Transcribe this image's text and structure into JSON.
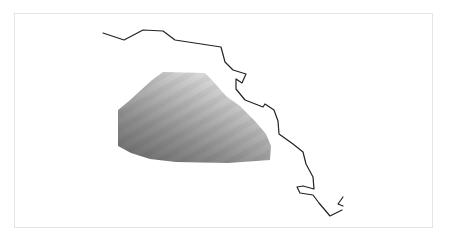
{
  "map": {
    "frame": {
      "x": 14,
      "y": 13,
      "width": 419,
      "height": 215,
      "border_color": "#e4e4e4"
    },
    "coastline": {
      "stroke": "#222222",
      "stroke_width": 1.2,
      "main_path": "M103,33 L124,40 L143,30 L163,31 L175,40 L221,47 L225,62 L233,70 L246,74 L242,83 L236,79 L236,89 L245,100 L263,107 L265,104 L274,110 L278,121 L279,134 L293,144 L303,152 L306,164 L313,177 L314,189 L303,186 L297,187 L300,193 L313,195 L319,203 L330,216 L342,210",
      "fragment_path": "M343,197 L338,204 L343,206"
    },
    "heat_region": {
      "outline": "M163,72 L205,73 L212,80 L226,96 L240,106 L254,120 L266,134 L271,146 L270,160 L228,163 L176,162 L150,159 L131,153 L118,146 L118,110 L129,101 L140,91 L152,80 Z",
      "gradient_stops": [
        {
          "offset": "0%",
          "color": "#eeeeee"
        },
        {
          "offset": "35%",
          "color": "#bdbdbd"
        },
        {
          "offset": "70%",
          "color": "#8e8e8e"
        },
        {
          "offset": "100%",
          "color": "#6e6e6e"
        }
      ],
      "gradient_direction": {
        "x1": "85%",
        "y1": "0%",
        "x2": "15%",
        "y2": "100%"
      }
    }
  }
}
